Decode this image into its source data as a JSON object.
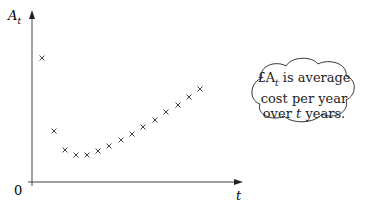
{
  "chart_data": {
    "type": "scatter",
    "title": "",
    "xlabel": "t",
    "ylabel": "A_t",
    "origin_label": "0",
    "grid": false,
    "legend": null,
    "marker": "x",
    "x": [
      1,
      2,
      3,
      4,
      5,
      6,
      7,
      8,
      9,
      10,
      11,
      12,
      13,
      14,
      15
    ],
    "y": [
      12.4,
      5.3,
      3.5,
      3.0,
      3.0,
      3.4,
      3.9,
      4.5,
      5.1,
      5.8,
      6.5,
      7.3,
      8.0,
      8.8,
      9.6
    ],
    "annotations": [
      {
        "type": "thought-bubble",
        "text": "£A_t is average cost per year over t years."
      }
    ]
  },
  "labels": {
    "y_axis": "A",
    "y_axis_sub": "t",
    "x_axis": "t",
    "origin": "0"
  },
  "callout": {
    "line1_prefix": "£A",
    "line1_sub": "t",
    "line1_rest": " is average",
    "line2": "cost per year",
    "line3_prefix": "over ",
    "line3_var": "t",
    "line3_rest": " years."
  },
  "points_px": [
    [
      42,
      58
    ],
    [
      54,
      131
    ],
    [
      65,
      150
    ],
    [
      76,
      155
    ],
    [
      87,
      155
    ],
    [
      98,
      151
    ],
    [
      109,
      146
    ],
    [
      121,
      140
    ],
    [
      132,
      134
    ],
    [
      143,
      127
    ],
    [
      155,
      120
    ],
    [
      166,
      112
    ],
    [
      178,
      105
    ],
    [
      189,
      97
    ],
    [
      200,
      89
    ]
  ]
}
